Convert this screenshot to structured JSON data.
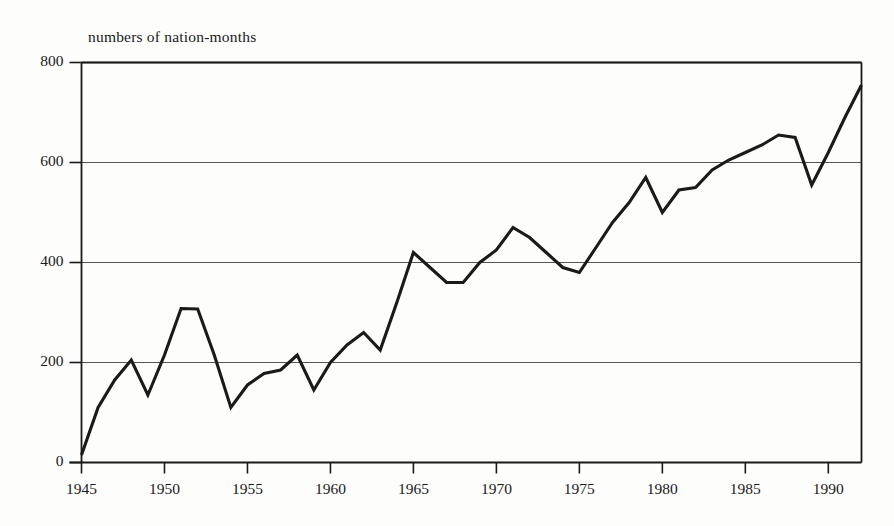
{
  "figure": {
    "background_color": "#fdfdfc",
    "line_color": "#1a1a1a",
    "grid_color": "#555555",
    "axis_color": "#1a1a1a"
  },
  "chart_data": {
    "type": "line",
    "title": "numbers of nation-months",
    "subtitle": "",
    "xlabel": "",
    "ylabel": "numbers of nation-months",
    "xlim": [
      1945,
      1992
    ],
    "ylim": [
      0,
      800
    ],
    "grid": true,
    "legend": false,
    "legend_position": "none",
    "y_ticks": [
      0,
      200,
      400,
      600,
      800
    ],
    "y_tick_labels": [
      "0",
      "200",
      "400",
      "600",
      "800"
    ],
    "x_ticks": [
      1945,
      1950,
      1955,
      1960,
      1965,
      1970,
      1975,
      1980,
      1985,
      1990
    ],
    "x_tick_labels": [
      "1945",
      "1950",
      "1955",
      "1960",
      "1965",
      "1970",
      "1975",
      "1980",
      "1985",
      "1990"
    ],
    "x": [
      1945,
      1946,
      1947,
      1948,
      1949,
      1950,
      1951,
      1952,
      1953,
      1954,
      1955,
      1956,
      1957,
      1958,
      1959,
      1960,
      1961,
      1962,
      1963,
      1964,
      1965,
      1966,
      1967,
      1968,
      1969,
      1970,
      1971,
      1972,
      1973,
      1974,
      1975,
      1976,
      1977,
      1978,
      1979,
      1980,
      1981,
      1982,
      1983,
      1984,
      1985,
      1986,
      1987,
      1988,
      1989,
      1990,
      1991,
      1992
    ],
    "series": [
      {
        "name": "nation-months",
        "values": [
          15,
          110,
          165,
          205,
          135,
          215,
          308,
          307,
          215,
          110,
          155,
          178,
          185,
          215,
          145,
          200,
          235,
          260,
          225,
          320,
          420,
          390,
          360,
          360,
          400,
          425,
          470,
          450,
          420,
          390,
          380,
          430,
          480,
          520,
          570,
          500,
          545,
          550,
          585,
          605,
          620,
          635,
          655,
          650,
          555,
          620,
          690,
          755
        ]
      }
    ]
  }
}
